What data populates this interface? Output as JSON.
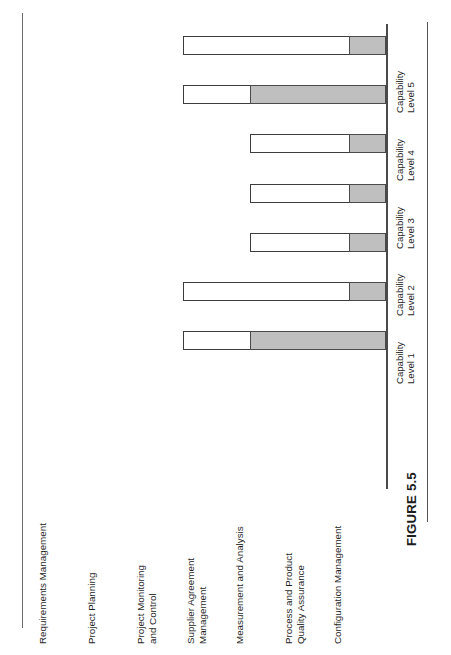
{
  "figure": {
    "caption": "FIGURE 5.5"
  },
  "chart_data": {
    "type": "bar",
    "orientation": "horizontal",
    "title": "",
    "xlabel": "",
    "ylabel": "",
    "grid": false,
    "legend": false,
    "xlim": [
      0,
      5
    ],
    "axis_tick_labels": [
      {
        "line1": "Capability",
        "line2": "Level 1"
      },
      {
        "line1": "Capability",
        "line2": "Level 2"
      },
      {
        "line1": "Capability",
        "line2": "Level 3"
      },
      {
        "line1": "Capability",
        "line2": "Level 4"
      },
      {
        "line1": "Capability",
        "line2": "Level 5"
      }
    ],
    "categories": [
      {
        "line1": "Requirements Management",
        "line2": ""
      },
      {
        "line1": "Project Planning",
        "line2": ""
      },
      {
        "line1": "Project Monitoring",
        "line2": "and Control"
      },
      {
        "line1": "Supplier Agreement",
        "line2": "Management"
      },
      {
        "line1": "Measurement and Analysis",
        "line2": ""
      },
      {
        "line1": "Process and Product",
        "line2": "Quality Assurance"
      },
      {
        "line1": "Configuration Management",
        "line2": ""
      }
    ],
    "series": [
      {
        "name": "Target Capability Level",
        "style": "outline",
        "values": [
          3,
          3,
          2,
          2,
          2,
          3,
          3
        ]
      },
      {
        "name": "Achieved Capability Level",
        "style": "filled",
        "color": "#bfbfbf",
        "values": [
          0.55,
          2,
          0.55,
          0.55,
          0.55,
          0.55,
          2
        ]
      }
    ],
    "colors": {
      "fill": "#bfbfbf",
      "outline": "#3d3d3d",
      "axis": "#4a4a4a",
      "text": "#1f1f1f"
    }
  }
}
